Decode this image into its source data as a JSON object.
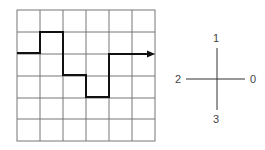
{
  "grid": {
    "rows": 6,
    "cols": 6
  },
  "path": {
    "description": "step path entering from left, moving right with arrow at end",
    "moves": [
      0,
      1,
      0,
      3,
      0,
      3,
      0,
      1,
      1,
      0,
      0
    ]
  },
  "compass": {
    "right": "0",
    "up": "1",
    "left": "2",
    "down": "3"
  }
}
